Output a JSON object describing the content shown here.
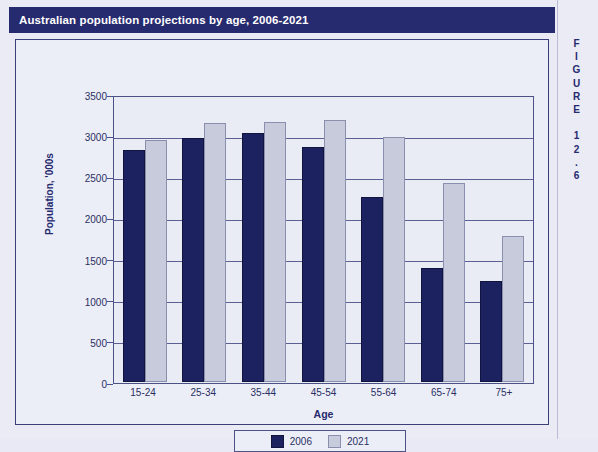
{
  "figure": {
    "title": "Australian population projections by age, 2006-2021",
    "side_label": "FIGURE 12.6"
  },
  "colors": {
    "title_bar": "#262a6e",
    "series_2006": "#1c2160",
    "series_2021": "#c8cbdc",
    "axis": "#4c5186",
    "page_background": "#eaebf5"
  },
  "chart_data": {
    "type": "bar",
    "title": "Australian population projections by age, 2006-2021",
    "xlabel": "Age",
    "ylabel": "Population, '000s",
    "ylim": [
      0,
      3500
    ],
    "yticks": [
      0,
      500,
      1000,
      1500,
      2000,
      2500,
      3000,
      3500
    ],
    "ytick_labels": [
      "0",
      "500",
      "1000",
      "1500",
      "2000",
      "2500",
      "3000",
      "3500"
    ],
    "grid": true,
    "legend_position": "bottom",
    "categories": [
      "15-24",
      "25-34",
      "35-44",
      "45-54",
      "55-64",
      "65-74",
      "75+"
    ],
    "series": [
      {
        "name": "2006",
        "values": [
          2820,
          2960,
          3030,
          2860,
          2250,
          1380,
          1230
        ]
      },
      {
        "name": "2021",
        "values": [
          2940,
          3150,
          3160,
          3180,
          2980,
          2420,
          1780
        ]
      }
    ]
  }
}
